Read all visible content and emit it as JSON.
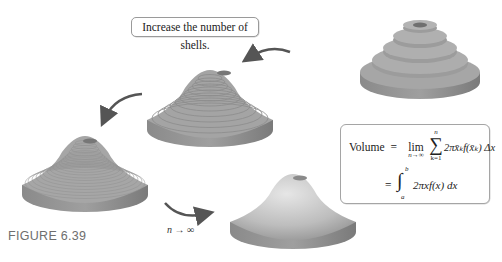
{
  "figure": {
    "caption": "FIGURE 6.39",
    "callout_text": "Increase the number of shells.",
    "limit_label": "n → ∞",
    "formula": {
      "lhs": "Volume",
      "equals": "=",
      "lim": "lim",
      "lim_sub": "n→∞",
      "sum_top": "n",
      "sum_bottom": "k=1",
      "sum_symbol": "∑",
      "summand": "2πx̄ₖf(x̄ₖ) Δx",
      "integral_symbol": "∫",
      "int_upper": "b",
      "int_lower": "a",
      "integrand": "2πxf(x) dx"
    },
    "solids": [
      {
        "name": "few-shells-solid",
        "shells": 5
      },
      {
        "name": "more-shells-solid",
        "shells": 12
      },
      {
        "name": "many-shells-solid",
        "shells": 20
      },
      {
        "name": "smooth-solid",
        "shells": 0
      }
    ],
    "colors": {
      "solid_fill": "#9a9a9a",
      "solid_side": "#7d7d7d",
      "arrow": "#555555",
      "caption": "#6e6e6e"
    }
  }
}
